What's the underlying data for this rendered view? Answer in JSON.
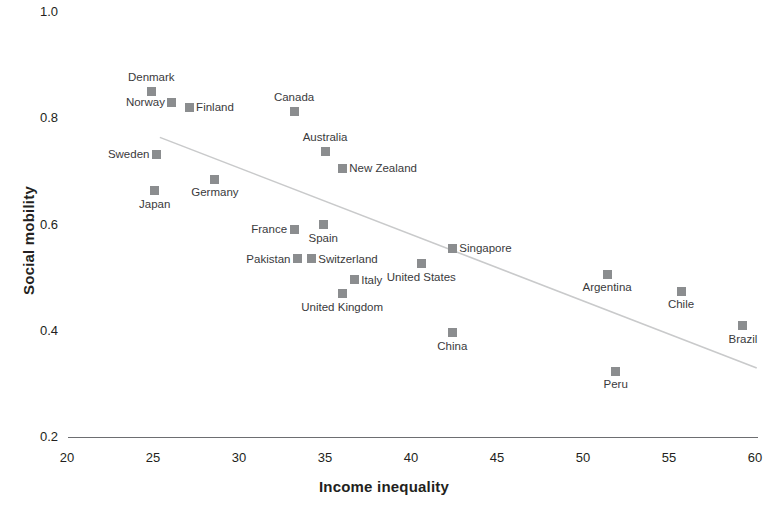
{
  "chart_data": {
    "type": "scatter",
    "title": "",
    "xlabel": "Income inequality",
    "ylabel": "Social mobility",
    "xlim": [
      20,
      60
    ],
    "ylim": [
      0.2,
      1.0
    ],
    "xticks": [
      "20",
      "25",
      "30",
      "35",
      "40",
      "45",
      "50",
      "55",
      "60"
    ],
    "yticks": [
      "0.2",
      "0.4",
      "0.6",
      "0.8",
      "1.0"
    ],
    "grid": false,
    "legend": null,
    "marker_color": "#8b8d8f",
    "trendline": {
      "present": true,
      "color": "#c9cacb",
      "x_start": 25.4,
      "y_start": 0.764,
      "x_end": 60.1,
      "y_end": 0.33
    },
    "points": [
      {
        "label": "Denmark",
        "x": 24.9,
        "y": 0.851,
        "pos": "top"
      },
      {
        "label": "Norway",
        "x": 26.1,
        "y": 0.83,
        "pos": "left"
      },
      {
        "label": "Finland",
        "x": 27.1,
        "y": 0.821,
        "pos": "right"
      },
      {
        "label": "Canada",
        "x": 33.2,
        "y": 0.813,
        "pos": "top"
      },
      {
        "label": "Sweden",
        "x": 25.2,
        "y": 0.732,
        "pos": "left"
      },
      {
        "label": "Australia",
        "x": 35.0,
        "y": 0.738,
        "pos": "top"
      },
      {
        "label": "New Zealand",
        "x": 36.0,
        "y": 0.706,
        "pos": "right"
      },
      {
        "label": "Germany",
        "x": 28.6,
        "y": 0.685,
        "pos": "bottom"
      },
      {
        "label": "Japan",
        "x": 25.1,
        "y": 0.664,
        "pos": "bottom"
      },
      {
        "label": "France",
        "x": 33.2,
        "y": 0.591,
        "pos": "left"
      },
      {
        "label": "Spain",
        "x": 34.9,
        "y": 0.6,
        "pos": "bottom"
      },
      {
        "label": "Pakistan",
        "x": 33.4,
        "y": 0.536,
        "pos": "left"
      },
      {
        "label": "Switzerland",
        "x": 34.2,
        "y": 0.536,
        "pos": "right"
      },
      {
        "label": "Italy",
        "x": 36.7,
        "y": 0.496,
        "pos": "right"
      },
      {
        "label": "United Kingdom",
        "x": 36.0,
        "y": 0.47,
        "pos": "bottom"
      },
      {
        "label": "Singapore",
        "x": 42.4,
        "y": 0.555,
        "pos": "right"
      },
      {
        "label": "United States",
        "x": 40.6,
        "y": 0.526,
        "pos": "bottom"
      },
      {
        "label": "China",
        "x": 42.4,
        "y": 0.396,
        "pos": "bottom"
      },
      {
        "label": "Argentina",
        "x": 51.4,
        "y": 0.506,
        "pos": "bottom"
      },
      {
        "label": "Chile",
        "x": 55.7,
        "y": 0.474,
        "pos": "bottom"
      },
      {
        "label": "Brazil",
        "x": 59.3,
        "y": 0.409,
        "pos": "bottom"
      },
      {
        "label": "Peru",
        "x": 51.9,
        "y": 0.324,
        "pos": "bottom"
      }
    ]
  }
}
